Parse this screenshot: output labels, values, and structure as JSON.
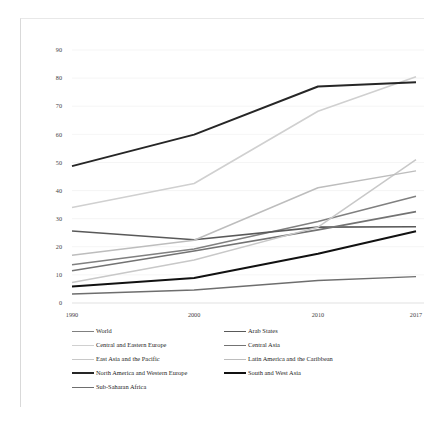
{
  "chart_data": {
    "type": "line",
    "title": "",
    "subtitle": "",
    "xlabel": "",
    "ylabel": "",
    "x": [
      "1990",
      "2000",
      "2010",
      "2017"
    ],
    "categories": [
      "1990",
      "2000",
      "2010",
      "2017"
    ],
    "ylim": [
      0,
      90
    ],
    "ytick_labels": [
      "0",
      "10",
      "20",
      "30",
      "40",
      "50",
      "60",
      "70",
      "80",
      "90"
    ],
    "ytick_values": [
      0,
      10,
      20,
      30,
      40,
      50,
      60,
      70,
      80,
      90
    ],
    "grid": true,
    "legend_position": "bottom",
    "series": [
      {
        "name": "World",
        "color": "#808080",
        "width": 1.5,
        "values": [
          13.6,
          19.2,
          29.0,
          38.0
        ]
      },
      {
        "name": "Arab States",
        "color": "#595959",
        "width": 1.6,
        "values": [
          25.6,
          22.5,
          27.0,
          27.1
        ]
      },
      {
        "name": "Central and Eastern Europe",
        "color": "#d0d0d0",
        "width": 1.6,
        "values": [
          34.0,
          42.5,
          68.2,
          80.5
        ]
      },
      {
        "name": "Central Asia",
        "color": "#737373",
        "width": 1.6,
        "values": [
          11.5,
          18.5,
          26.0,
          32.5
        ]
      },
      {
        "name": "East Asia and the Pacific",
        "color": "#c8c8c8",
        "width": 1.5,
        "values": [
          7.3,
          15.3,
          27.0,
          51.0
        ]
      },
      {
        "name": "Latin America and the Caribbean",
        "color": "#bdbdbd",
        "width": 1.5,
        "values": [
          17.0,
          22.3,
          41.0,
          47.0
        ]
      },
      {
        "name": "North America and Western Europe",
        "color": "#262626",
        "width": 2.0,
        "values": [
          48.7,
          59.9,
          77.0,
          78.5
        ]
      },
      {
        "name": "South and West Asia",
        "color": "#111111",
        "width": 2.0,
        "values": [
          5.9,
          8.9,
          17.5,
          25.5
        ]
      },
      {
        "name": "Sub-Saharan Africa",
        "color": "#6e6e6e",
        "width": 1.4,
        "values": [
          3.2,
          4.6,
          8.0,
          9.4
        ]
      }
    ]
  },
  "legend": {
    "rows": [
      [
        {
          "label": "World",
          "color": "#808080",
          "width": 1.5
        },
        {
          "label": "Arab States",
          "color": "#595959",
          "width": 1.8
        }
      ],
      [
        {
          "label": "Central and Eastern Europe",
          "color": "#d0d0d0",
          "width": 1.5
        },
        {
          "label": "Central Asia",
          "color": "#737373",
          "width": 1.8
        }
      ],
      [
        {
          "label": "East Asia and the Pacific",
          "color": "#c8c8c8",
          "width": 1.5
        },
        {
          "label": "Latin America and the Caribbean",
          "color": "#bdbdbd",
          "width": 1.5
        }
      ],
      [
        {
          "label": "North America and Western Europe",
          "color": "#262626",
          "width": 2.2
        },
        {
          "label": "South and West Asia",
          "color": "#111111",
          "width": 2.2
        }
      ],
      [
        {
          "label": "Sub-Saharan Africa",
          "color": "#6e6e6e",
          "width": 1.8
        }
      ]
    ]
  }
}
